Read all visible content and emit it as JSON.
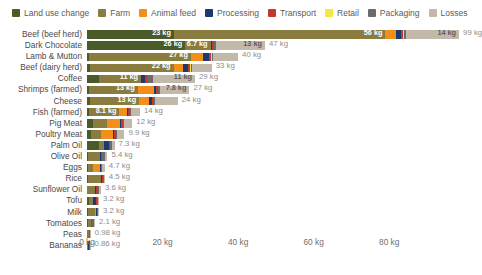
{
  "legend": {
    "items": [
      {
        "label": "Land use change",
        "color": "#4a5a28",
        "key": "land_use_change"
      },
      {
        "label": "Farm",
        "color": "#8a7b3f",
        "key": "farm"
      },
      {
        "label": "Animal feed",
        "color": "#f28e1c",
        "key": "animal_feed"
      },
      {
        "label": "Processing",
        "color": "#1b3a73",
        "key": "processing"
      },
      {
        "label": "Transport",
        "color": "#c0392b",
        "key": "transport"
      },
      {
        "label": "Retail",
        "color": "#f5e642",
        "key": "retail"
      },
      {
        "label": "Packaging",
        "color": "#6b6b6b",
        "key": "packaging"
      },
      {
        "label": "Losses",
        "color": "#c3b9ab",
        "key": "losses"
      }
    ]
  },
  "axis": {
    "unit": "kg",
    "ticks": [
      "0 kg",
      "20 kg",
      "40 kg",
      "60 kg",
      "80 kg"
    ],
    "tick_values": [
      0,
      20,
      40,
      60,
      80
    ],
    "xmin": 0,
    "xmax": 99
  },
  "chart_data": {
    "type": "bar",
    "orientation": "horizontal",
    "stacked": true,
    "title": "",
    "xlabel": "",
    "ylabel": "",
    "xlim": [
      0,
      99
    ],
    "grid": false,
    "legend_position": "top-left",
    "series": [
      {
        "name": "Land use change",
        "color": "#4a5a28"
      },
      {
        "name": "Farm",
        "color": "#8a7b3f"
      },
      {
        "name": "Animal feed",
        "color": "#f28e1c"
      },
      {
        "name": "Processing",
        "color": "#1b3a73"
      },
      {
        "name": "Transport",
        "color": "#c0392b"
      },
      {
        "name": "Retail",
        "color": "#f5e642"
      },
      {
        "name": "Packaging",
        "color": "#6b6b6b"
      },
      {
        "name": "Losses",
        "color": "#c3b9ab"
      }
    ],
    "categories": [
      "Beef (beef herd)",
      "Dark Chocolate",
      "Lamb & Mutton",
      "Beef (dairy herd)",
      "Coffee",
      "Shrimps (farmed)",
      "Cheese",
      "Fish (farmed)",
      "Pig Meat",
      "Poultry Meat",
      "Palm Oil",
      "Olive Oil",
      "Eggs",
      "Rice",
      "Sunflower Oil",
      "Tofu",
      "Milk",
      "Tomatoes",
      "Peas",
      "Bananas"
    ],
    "rows": [
      {
        "label": "Beef (beef herd)",
        "total": 99,
        "total_label": "99 kg",
        "segments": [
          {
            "key": "land_use_change",
            "value": 23,
            "label": "23 kg"
          },
          {
            "key": "farm",
            "value": 56,
            "label": "56 kg"
          },
          {
            "key": "animal_feed",
            "value": 2.8,
            "label": ""
          },
          {
            "key": "processing",
            "value": 1.3,
            "label": ""
          },
          {
            "key": "transport",
            "value": 0.6,
            "label": ""
          },
          {
            "key": "retail",
            "value": 0.3,
            "label": ""
          },
          {
            "key": "packaging",
            "value": 0.5,
            "label": ""
          },
          {
            "key": "losses",
            "value": 14,
            "label": "14 kg"
          }
        ]
      },
      {
        "label": "Dark Chocolate",
        "total": 47,
        "total_label": "47 kg",
        "segments": [
          {
            "key": "land_use_change",
            "value": 26,
            "label": "26 kg"
          },
          {
            "key": "farm",
            "value": 6.7,
            "label": "6.7 kg"
          },
          {
            "key": "processing",
            "value": 0.4,
            "label": ""
          },
          {
            "key": "transport",
            "value": 0.4,
            "label": ""
          },
          {
            "key": "packaging",
            "value": 0.6,
            "label": ""
          },
          {
            "key": "losses",
            "value": 13,
            "label": "13 kg"
          }
        ]
      },
      {
        "label": "Lamb & Mutton",
        "total": 40,
        "total_label": "40 kg",
        "segments": [
          {
            "key": "land_use_change",
            "value": 0.5,
            "label": ""
          },
          {
            "key": "farm",
            "value": 27,
            "label": "27 kg"
          },
          {
            "key": "animal_feed",
            "value": 3.3,
            "label": ""
          },
          {
            "key": "processing",
            "value": 1.6,
            "label": ""
          },
          {
            "key": "transport",
            "value": 0.5,
            "label": ""
          },
          {
            "key": "retail",
            "value": 0.3,
            "label": ""
          },
          {
            "key": "packaging",
            "value": 0.3,
            "label": ""
          },
          {
            "key": "losses",
            "value": 6.5,
            "label": ""
          }
        ]
      },
      {
        "label": "Beef (dairy herd)",
        "total": 33,
        "total_label": "33 kg",
        "segments": [
          {
            "key": "land_use_change",
            "value": 0.9,
            "label": ""
          },
          {
            "key": "farm",
            "value": 22,
            "label": "22 kg"
          },
          {
            "key": "animal_feed",
            "value": 2.5,
            "label": ""
          },
          {
            "key": "processing",
            "value": 1.3,
            "label": ""
          },
          {
            "key": "transport",
            "value": 0.5,
            "label": ""
          },
          {
            "key": "retail",
            "value": 0.3,
            "label": ""
          },
          {
            "key": "packaging",
            "value": 0.3,
            "label": ""
          },
          {
            "key": "losses",
            "value": 5.2,
            "label": ""
          }
        ]
      },
      {
        "label": "Coffee",
        "total": 29,
        "total_label": "29 kg",
        "segments": [
          {
            "key": "land_use_change",
            "value": 3.3,
            "label": ""
          },
          {
            "key": "farm",
            "value": 11,
            "label": "11 kg"
          },
          {
            "key": "processing",
            "value": 1.0,
            "label": ""
          },
          {
            "key": "transport",
            "value": 0.5,
            "label": ""
          },
          {
            "key": "packaging",
            "value": 1.8,
            "label": ""
          },
          {
            "key": "losses",
            "value": 11,
            "label": "11 kg"
          }
        ]
      },
      {
        "label": "Shrimps (farmed)",
        "total": 27,
        "total_label": "27 kg",
        "segments": [
          {
            "key": "land_use_change",
            "value": 0.4,
            "label": ""
          },
          {
            "key": "farm",
            "value": 13,
            "label": "13 kg"
          },
          {
            "key": "animal_feed",
            "value": 4.4,
            "label": ""
          },
          {
            "key": "processing",
            "value": 0.4,
            "label": ""
          },
          {
            "key": "transport",
            "value": 0.6,
            "label": ""
          },
          {
            "key": "packaging",
            "value": 0.5,
            "label": ""
          },
          {
            "key": "losses",
            "value": 7.8,
            "label": "7.8 kg"
          }
        ]
      },
      {
        "label": "Cheese",
        "total": 24,
        "total_label": "24 kg",
        "segments": [
          {
            "key": "land_use_change",
            "value": 0.8,
            "label": ""
          },
          {
            "key": "farm",
            "value": 13,
            "label": "13 kg"
          },
          {
            "key": "animal_feed",
            "value": 2.7,
            "label": ""
          },
          {
            "key": "processing",
            "value": 0.8,
            "label": ""
          },
          {
            "key": "transport",
            "value": 0.4,
            "label": ""
          },
          {
            "key": "packaging",
            "value": 0.4,
            "label": ""
          },
          {
            "key": "losses",
            "value": 5.9,
            "label": ""
          }
        ]
      },
      {
        "label": "Fish (farmed)",
        "total": 14,
        "total_label": "14 kg",
        "segments": [
          {
            "key": "land_use_change",
            "value": 0.5,
            "label": ""
          },
          {
            "key": "farm",
            "value": 8.1,
            "label": "8.1 kg"
          },
          {
            "key": "animal_feed",
            "value": 1.9,
            "label": ""
          },
          {
            "key": "processing",
            "value": 0.3,
            "label": ""
          },
          {
            "key": "transport",
            "value": 0.5,
            "label": ""
          },
          {
            "key": "packaging",
            "value": 0.3,
            "label": ""
          },
          {
            "key": "losses",
            "value": 2.4,
            "label": ""
          }
        ]
      },
      {
        "label": "Pig Meat",
        "total": 12,
        "total_label": "12 kg",
        "segments": [
          {
            "key": "land_use_change",
            "value": 1.5,
            "label": ""
          },
          {
            "key": "farm",
            "value": 3.9,
            "label": ""
          },
          {
            "key": "animal_feed",
            "value": 3.3,
            "label": ""
          },
          {
            "key": "processing",
            "value": 0.4,
            "label": ""
          },
          {
            "key": "transport",
            "value": 0.4,
            "label": ""
          },
          {
            "key": "packaging",
            "value": 0.3,
            "label": ""
          },
          {
            "key": "losses",
            "value": 2.2,
            "label": ""
          }
        ]
      },
      {
        "label": "Poultry Meat",
        "total": 9.9,
        "total_label": "9.9 kg",
        "segments": [
          {
            "key": "land_use_change",
            "value": 1.0,
            "label": ""
          },
          {
            "key": "farm",
            "value": 2.6,
            "label": ""
          },
          {
            "key": "animal_feed",
            "value": 3.3,
            "label": ""
          },
          {
            "key": "processing",
            "value": 0.3,
            "label": ""
          },
          {
            "key": "transport",
            "value": 0.4,
            "label": ""
          },
          {
            "key": "packaging",
            "value": 0.3,
            "label": ""
          },
          {
            "key": "losses",
            "value": 2.0,
            "label": ""
          }
        ]
      },
      {
        "label": "Palm Oil",
        "total": 7.3,
        "total_label": "7.3 kg",
        "segments": [
          {
            "key": "land_use_change",
            "value": 3.1,
            "label": ""
          },
          {
            "key": "farm",
            "value": 1.5,
            "label": ""
          },
          {
            "key": "processing",
            "value": 1.1,
            "label": ""
          },
          {
            "key": "transport",
            "value": 0.3,
            "label": ""
          },
          {
            "key": "packaging",
            "value": 0.5,
            "label": ""
          },
          {
            "key": "losses",
            "value": 0.8,
            "label": ""
          }
        ]
      },
      {
        "label": "Olive Oil",
        "total": 5.4,
        "total_label": "5.4 kg",
        "segments": [
          {
            "key": "land_use_change",
            "value": 0.3,
            "label": ""
          },
          {
            "key": "farm",
            "value": 3.1,
            "label": ""
          },
          {
            "key": "processing",
            "value": 0.4,
            "label": ""
          },
          {
            "key": "transport",
            "value": 0.3,
            "label": ""
          },
          {
            "key": "packaging",
            "value": 0.6,
            "label": ""
          },
          {
            "key": "losses",
            "value": 0.7,
            "label": ""
          }
        ]
      },
      {
        "label": "Eggs",
        "total": 4.7,
        "total_label": "4.7 kg",
        "segments": [
          {
            "key": "land_use_change",
            "value": 0.3,
            "label": ""
          },
          {
            "key": "farm",
            "value": 1.2,
            "label": ""
          },
          {
            "key": "animal_feed",
            "value": 1.9,
            "label": ""
          },
          {
            "key": "processing",
            "value": 0.2,
            "label": ""
          },
          {
            "key": "transport",
            "value": 0.2,
            "label": ""
          },
          {
            "key": "packaging",
            "value": 0.3,
            "label": ""
          },
          {
            "key": "losses",
            "value": 0.6,
            "label": ""
          }
        ]
      },
      {
        "label": "Rice",
        "total": 4.5,
        "total_label": "4.5 kg",
        "segments": [
          {
            "key": "land_use_change",
            "value": 0.2,
            "label": ""
          },
          {
            "key": "farm",
            "value": 3.6,
            "label": ""
          },
          {
            "key": "processing",
            "value": 0.2,
            "label": ""
          },
          {
            "key": "transport",
            "value": 0.2,
            "label": ""
          },
          {
            "key": "packaging",
            "value": 0.2,
            "label": ""
          },
          {
            "key": "losses",
            "value": 0.3,
            "label": ""
          }
        ]
      },
      {
        "label": "Sunflower Oil",
        "total": 3.6,
        "total_label": "3.6 kg",
        "segments": [
          {
            "key": "farm",
            "value": 2.0,
            "label": ""
          },
          {
            "key": "processing",
            "value": 0.5,
            "label": ""
          },
          {
            "key": "transport",
            "value": 0.3,
            "label": ""
          },
          {
            "key": "packaging",
            "value": 0.5,
            "label": ""
          },
          {
            "key": "losses",
            "value": 0.4,
            "label": ""
          }
        ]
      },
      {
        "label": "Tofu",
        "total": 3.2,
        "total_label": "3.2 kg",
        "segments": [
          {
            "key": "land_use_change",
            "value": 0.5,
            "label": ""
          },
          {
            "key": "farm",
            "value": 1.0,
            "label": ""
          },
          {
            "key": "processing",
            "value": 0.9,
            "label": ""
          },
          {
            "key": "transport",
            "value": 0.3,
            "label": ""
          },
          {
            "key": "packaging",
            "value": 0.2,
            "label": ""
          },
          {
            "key": "losses",
            "value": 0.3,
            "label": ""
          }
        ]
      },
      {
        "label": "Milk",
        "total": 3.2,
        "total_label": "3.2 kg",
        "segments": [
          {
            "key": "land_use_change",
            "value": 0.3,
            "label": ""
          },
          {
            "key": "farm",
            "value": 1.7,
            "label": ""
          },
          {
            "key": "animal_feed",
            "value": 0.4,
            "label": ""
          },
          {
            "key": "processing",
            "value": 0.2,
            "label": ""
          },
          {
            "key": "transport",
            "value": 0.1,
            "label": ""
          },
          {
            "key": "packaging",
            "value": 0.2,
            "label": ""
          },
          {
            "key": "losses",
            "value": 0.3,
            "label": ""
          }
        ]
      },
      {
        "label": "Tomatoes",
        "total": 2.1,
        "total_label": "2.1 kg",
        "segments": [
          {
            "key": "land_use_change",
            "value": 0.3,
            "label": ""
          },
          {
            "key": "farm",
            "value": 0.7,
            "label": ""
          },
          {
            "key": "processing",
            "value": 0.1,
            "label": ""
          },
          {
            "key": "transport",
            "value": 0.2,
            "label": ""
          },
          {
            "key": "packaging",
            "value": 0.6,
            "label": ""
          },
          {
            "key": "losses",
            "value": 0.2,
            "label": ""
          }
        ]
      },
      {
        "label": "Peas",
        "total": 0.98,
        "total_label": "0.98 kg",
        "segments": [
          {
            "key": "farm",
            "value": 0.5,
            "label": ""
          },
          {
            "key": "processing",
            "value": 0.1,
            "label": ""
          },
          {
            "key": "transport",
            "value": 0.1,
            "label": ""
          },
          {
            "key": "packaging",
            "value": 0.2,
            "label": ""
          },
          {
            "key": "losses",
            "value": 0.1,
            "label": ""
          }
        ]
      },
      {
        "label": "Bananas",
        "total": 0.86,
        "total_label": "0.86 kg",
        "segments": [
          {
            "key": "farm",
            "value": 0.3,
            "label": ""
          },
          {
            "key": "processing",
            "value": 0.1,
            "label": ""
          },
          {
            "key": "transport",
            "value": 0.3,
            "label": ""
          },
          {
            "key": "packaging",
            "value": 0.1,
            "label": ""
          },
          {
            "key": "losses",
            "value": 0.1,
            "label": ""
          }
        ]
      }
    ]
  }
}
